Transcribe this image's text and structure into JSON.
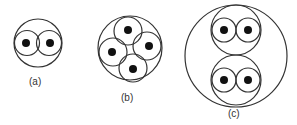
{
  "figure": {
    "panels": [
      {
        "label": "(a)",
        "description": "one circle containing two circles side by side, each with a central dot"
      },
      {
        "label": "(b)",
        "description": "one circle containing four circles arranged around the center, each with a central dot"
      },
      {
        "label": "(c)",
        "description": "one large circle containing two circles stacked vertically, each containing two circles with central dots"
      }
    ]
  }
}
